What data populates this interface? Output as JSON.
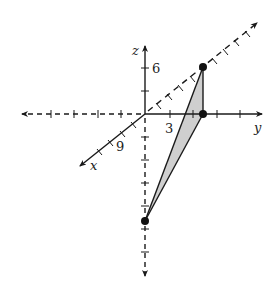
{
  "diagram": {
    "type": "3d-coordinate-axes",
    "axes": {
      "x": {
        "label": "x",
        "tick_label": "9"
      },
      "y": {
        "label": "y",
        "tick_label": "3"
      },
      "z": {
        "label": "z",
        "tick_label": "6"
      }
    },
    "points": [
      {
        "name": "point-on-z-6",
        "desc": "point at height 6 above y-axis"
      },
      {
        "name": "point-on-y",
        "desc": "point on y-axis"
      },
      {
        "name": "point-on-negative-z",
        "desc": "point on negative z-axis"
      }
    ],
    "colors": {
      "line": "#1a1a1a",
      "fill": "#cfcfcf",
      "background": "#ffffff"
    }
  }
}
